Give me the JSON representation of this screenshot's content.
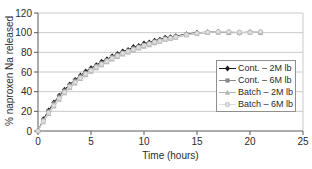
{
  "figure": {
    "background": "#ffffff"
  },
  "chart_data": {
    "type": "line",
    "title": "",
    "xlabel": "Time (hours)",
    "ylabel": "% naproxen Na released",
    "xlim": [
      0,
      25
    ],
    "ylim": [
      0,
      120
    ],
    "xticks": [
      0,
      5,
      10,
      15,
      20,
      25
    ],
    "yticks": [
      0,
      20,
      40,
      60,
      80,
      100,
      120
    ],
    "grid": "horizontal",
    "legend_position": "inside-right",
    "axis_color": "#5a5a5a",
    "grid_color": "#c9c9c9",
    "x": [
      0,
      0.5,
      1,
      1.5,
      2,
      2.5,
      3,
      3.5,
      4,
      4.5,
      5,
      5.5,
      6,
      6.5,
      7,
      7.5,
      8,
      8.5,
      9,
      9.5,
      10,
      10.5,
      11,
      11.5,
      12,
      12.5,
      13,
      14,
      15,
      16,
      17,
      18,
      19,
      20,
      21
    ],
    "series": [
      {
        "name": "Cont. – 2M lb",
        "marker": "diamond",
        "color": "#1a1a1a",
        "stroke": "#1a1a1a",
        "values": [
          0,
          12,
          21,
          29,
          36,
          42,
          47.5,
          52,
          56.5,
          60.5,
          64,
          67,
          70.5,
          73,
          76,
          78.5,
          81,
          82.5,
          85.5,
          86.5,
          89,
          90,
          92,
          93,
          95,
          95.5,
          96.5,
          98.5,
          100,
          100.5,
          101,
          100.5,
          100,
          100.5,
          100.5
        ]
      },
      {
        "name": "Cont. – 6M lb",
        "marker": "square",
        "color": "#8a8a8a",
        "stroke": "#8a8a8a",
        "values": [
          0,
          11,
          20,
          28,
          35,
          41,
          46.5,
          51,
          55.5,
          59,
          62.5,
          66,
          69,
          72,
          75,
          77.5,
          79.5,
          81.5,
          84,
          85.5,
          87.5,
          89,
          90.5,
          92,
          93.5,
          94.5,
          96,
          98,
          99.5,
          100,
          100.5,
          100,
          100,
          100.5,
          100
        ]
      },
      {
        "name": "Batch – 2M lb",
        "marker": "triangle",
        "color": "#b5b5b5",
        "stroke": "#b5b5b5",
        "values": [
          0,
          9,
          17.5,
          25,
          32,
          38.5,
          44,
          48.5,
          53,
          57,
          60.5,
          64,
          67,
          70,
          73,
          75.5,
          78,
          80,
          82,
          84,
          86,
          87.5,
          89.5,
          91,
          93,
          94,
          95,
          97.5,
          99,
          100,
          100.5,
          100.5,
          100,
          100,
          100.5
        ]
      },
      {
        "name": "Batch – 6M lb",
        "marker": "circle",
        "color": "#dfdfdf",
        "stroke": "#bdbdbd",
        "values": [
          0,
          10,
          18.5,
          26,
          33,
          39.5,
          45,
          49.5,
          54,
          58,
          61.5,
          65,
          68,
          71,
          74,
          76.5,
          79,
          81,
          83,
          85,
          87,
          88.5,
          90.5,
          91.5,
          93.5,
          94.5,
          95.5,
          98,
          99.5,
          100.5,
          101,
          101,
          100.5,
          100.5,
          101
        ]
      }
    ]
  }
}
